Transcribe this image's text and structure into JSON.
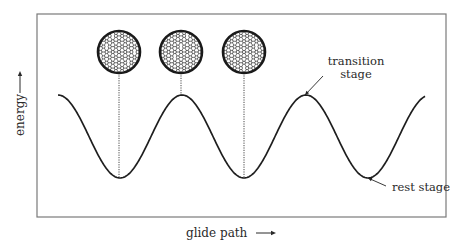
{
  "diagram": {
    "type": "energy-landscape",
    "frame": {
      "x": 37,
      "y": 14,
      "width": 409,
      "height": 203,
      "stroke": "#7a7a7a"
    },
    "axes": {
      "y_label": "energy",
      "y_arrow": "→",
      "x_label": "glide path",
      "x_arrow": "→"
    },
    "curve": {
      "stroke": "#1e1e1e",
      "start_x": 58,
      "end_x": 425,
      "peak_y": 95,
      "trough_y": 178,
      "period": 124,
      "phase_start": "peak",
      "peaks_x": [
        58,
        181,
        304,
        425
      ],
      "troughs_x": [
        119,
        244,
        367
      ]
    },
    "annotations": [
      {
        "id": "transition",
        "lines": [
          "transition",
          "stage"
        ],
        "text_x": 356,
        "text_y": 65,
        "arrow_from": [
          323,
          76
        ],
        "arrow_to": [
          305,
          95
        ]
      },
      {
        "id": "rest",
        "lines": [
          "rest stage"
        ],
        "text_x": 392,
        "text_y": 191,
        "arrow_from": [
          386,
          186
        ],
        "arrow_to": [
          368,
          178
        ]
      }
    ],
    "lattice_insets": [
      {
        "label": "lattice-at-trough-1",
        "cx": 119,
        "cy": 52,
        "r": 21,
        "line_to_y": 178,
        "variant": 1
      },
      {
        "label": "lattice-at-peak",
        "cx": 181,
        "cy": 52,
        "r": 21,
        "line_to_y": 95,
        "variant": 2
      },
      {
        "label": "lattice-at-trough-2",
        "cx": 244,
        "cy": 52,
        "r": 21,
        "line_to_y": 178,
        "variant": 3
      }
    ],
    "colors": {
      "ink": "#1e1e1e",
      "frame": "#7a7a7a",
      "text": "#2a2a2a",
      "atom_fill": "#ffffff",
      "background": "#ffffff"
    }
  }
}
